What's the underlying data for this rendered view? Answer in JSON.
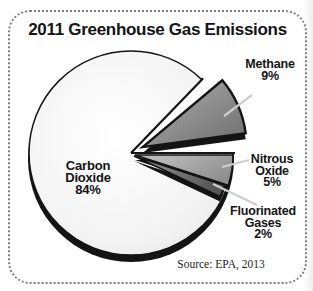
{
  "figure": {
    "title": "2011 Greenhouse Gas Emissions",
    "source_note": "Source: EPA, 2013"
  },
  "chart_data": {
    "type": "pie",
    "title": "2011 Greenhouse Gas Emissions",
    "unit": "percent",
    "slices": [
      {
        "label": "Carbon Dioxide",
        "value": 84
      },
      {
        "label": "Methane",
        "value": 9
      },
      {
        "label": "Nitrous Oxide",
        "value": 5
      },
      {
        "label": "Fluorinated Gases",
        "value": 2
      }
    ],
    "style": "grayscale 3D exploded pie with callout labels and leader lines",
    "legend_position": "callout-labels",
    "source": "Source: EPA, 2013"
  },
  "callouts": {
    "carbon_dioxide": {
      "lines": [
        "Carbon",
        "Dioxide",
        "84%"
      ]
    },
    "methane": {
      "lines": [
        "Methane",
        "9%"
      ]
    },
    "nitrous_oxide": {
      "lines": [
        "Nitrous",
        "Oxide",
        "5%"
      ]
    },
    "fluorinated_gases": {
      "lines": [
        "Fluorinated",
        "Gases",
        "2%"
      ]
    }
  },
  "colors": {
    "ink": "#141414",
    "background": "#ffffff",
    "co2_fill_center": "#ffffff",
    "co2_fill_mid": "#f4f4f4",
    "co2_fill_edge": "#e6e6e6",
    "methane_light": "#b0b0b0",
    "methane_dark": "#6d6d6d",
    "nitrous_light": "#c6c6c6",
    "nitrous_dark": "#8f8f8f",
    "fluorinated_light": "#9c9c9c",
    "fluorinated_dark": "#565656",
    "leader_line": "#cdcdcd",
    "border_dots": "#7f7f7f"
  }
}
